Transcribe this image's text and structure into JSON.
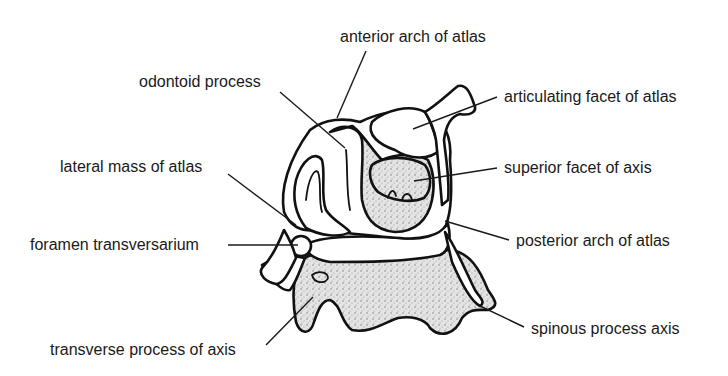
{
  "diagram": {
    "labels": [
      {
        "id": "anterior-arch",
        "text": "anterior arch of atlas",
        "x": 340,
        "y": 42,
        "line": [
          366,
          51,
          337,
          118
        ]
      },
      {
        "id": "odontoid",
        "text": "odontoid process",
        "x": 139,
        "y": 87,
        "line": [
          280,
          92,
          345,
          148
        ]
      },
      {
        "id": "articulating-facet",
        "text": "articulating facet of atlas",
        "x": 504,
        "y": 102,
        "line": [
          497,
          97,
          413,
          129
        ]
      },
      {
        "id": "lateral-mass",
        "text": "lateral mass of atlas",
        "x": 60,
        "y": 172,
        "line": [
          228,
          174,
          296,
          225
        ]
      },
      {
        "id": "superior-facet",
        "text": "superior facet of axis",
        "x": 504,
        "y": 173,
        "line": [
          497,
          168,
          414,
          181
        ]
      },
      {
        "id": "foramen",
        "text": "foramen transversarium",
        "x": 30,
        "y": 250,
        "line": [
          228,
          245,
          298,
          245
        ]
      },
      {
        "id": "posterior-arch",
        "text": "posterior arch of atlas",
        "x": 516,
        "y": 246,
        "line": [
          509,
          240,
          445,
          221
        ]
      },
      {
        "id": "transverse-process",
        "text": "transverse process of axis",
        "x": 50,
        "y": 355,
        "line": [
          266,
          345,
          313,
          297
        ]
      },
      {
        "id": "spinous-process",
        "text": "spinous process axis",
        "x": 531,
        "y": 334,
        "line": [
          524,
          327,
          480,
          306
        ]
      }
    ]
  }
}
